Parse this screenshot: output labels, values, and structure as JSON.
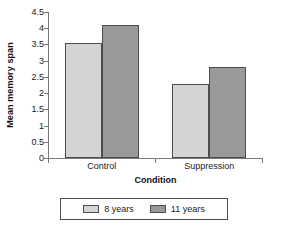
{
  "chart_data": {
    "type": "bar",
    "title": "",
    "subtitle": "",
    "xlabel": "Condition",
    "ylabel": "Mean memory span",
    "categories": [
      "Control",
      "Suppression"
    ],
    "series": [
      {
        "name": "8 years",
        "values": [
          3.53,
          2.27
        ],
        "color": "#d4d4d4"
      },
      {
        "name": "11 years",
        "values": [
          4.1,
          2.82
        ],
        "color": "#999999"
      }
    ],
    "ylim": [
      0,
      4.5
    ],
    "yticks": [
      0,
      0.5,
      1,
      1.5,
      2,
      2.5,
      3,
      3.5,
      4,
      4.5
    ],
    "ytick_labels": [
      "0",
      "0.5",
      "1",
      "1.5",
      "2",
      "2.5",
      "3",
      "3.5",
      "4",
      "4.5"
    ],
    "grid": false,
    "legend_position": "bottom",
    "bar_edge_color": "#4d4d4d",
    "axis_color": "#7a7a7a",
    "background": "#ffffff"
  },
  "legend": {
    "entries": [
      {
        "label": "8 years"
      },
      {
        "label": "11 years"
      }
    ]
  }
}
